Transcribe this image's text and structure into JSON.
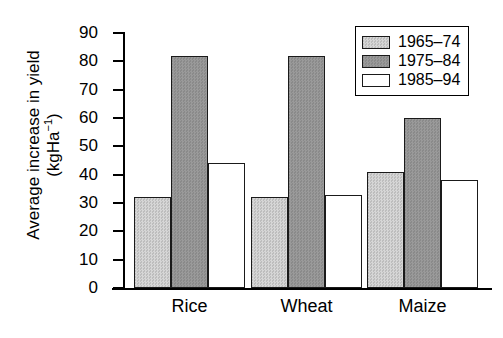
{
  "chart_data": {
    "type": "bar",
    "title": "",
    "xlabel": "",
    "ylabel": "Average increase in yield (kgHa⁻¹)",
    "ylabel_line1": "Average increase in yield",
    "ylabel_line2_prefix": "(kgHa",
    "ylabel_line2_sup": "−1",
    "ylabel_line2_suffix": ")",
    "categories": [
      "Rice",
      "Wheat",
      "Maize"
    ],
    "series": [
      {
        "name": "1965–74",
        "values": [
          32,
          32,
          41
        ],
        "color": "#cccccc"
      },
      {
        "name": "1975–84",
        "values": [
          82,
          82,
          60
        ],
        "color": "#949494"
      },
      {
        "name": "1985–94",
        "values": [
          44,
          33,
          38
        ],
        "color": "#ffffff"
      }
    ],
    "ylim": [
      0,
      90
    ],
    "ytick_values": [
      90,
      80,
      70,
      60,
      50,
      40,
      30,
      20,
      10,
      0
    ],
    "ytick_labels": [
      "90",
      "80",
      "70",
      "60",
      "50",
      "40",
      "30",
      "20",
      "10",
      "0"
    ],
    "grid": false,
    "legend_position": "top-right",
    "legend_entries": [
      "1965–74",
      "1975–84",
      "1985–94"
    ],
    "axis_color": "#000000",
    "bar_edge_color": "#1a1a1a",
    "background": "#ffffff"
  }
}
